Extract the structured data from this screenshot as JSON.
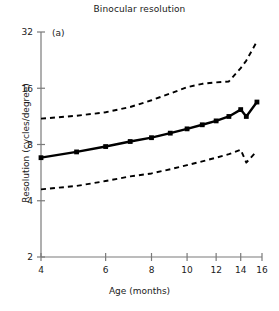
{
  "figure": {
    "title": "Binocular resolution",
    "panel_label": "(a)",
    "xlabel": "Age (months)",
    "ylabel": "Resolution (cycles/degree)",
    "line_color": "#000000",
    "background": "#ffffff",
    "axis_color": "#7a7a7a"
  },
  "chart_data": {
    "type": "line",
    "title": "Binocular resolution",
    "xlabel": "Age (months)",
    "ylabel": "Resolution (cycles/degree)",
    "annotations": [
      "(a)"
    ],
    "xscale": "log",
    "yscale": "log2",
    "xlim": [
      4,
      16
    ],
    "ylim": [
      2,
      32
    ],
    "xticks": [
      4,
      6,
      8,
      10,
      12,
      14,
      16
    ],
    "xticklabels": [
      "4",
      "6",
      "8",
      "10",
      "12",
      "14",
      "16"
    ],
    "yticks": [
      2,
      4,
      8,
      16,
      32
    ],
    "yticklabels": [
      "2",
      "4",
      "8",
      "16",
      "32"
    ],
    "grid": false,
    "legend": "none",
    "series": [
      {
        "name": "mean resolution",
        "style": "solid",
        "marker": "square",
        "x": [
          4.0,
          5.0,
          6.0,
          7.0,
          8.0,
          9.0,
          10.0,
          11.0,
          12.0,
          13.0,
          14.0,
          14.5,
          15.5
        ],
        "values": [
          6.8,
          7.3,
          7.8,
          8.3,
          8.7,
          9.2,
          9.7,
          10.2,
          10.7,
          11.3,
          12.3,
          11.3,
          13.5
        ]
      },
      {
        "name": "upper bound",
        "style": "dashed",
        "marker": "none",
        "x": [
          4.0,
          5.0,
          6.0,
          7.0,
          8.0,
          9.0,
          10.0,
          11.0,
          12.0,
          13.0,
          14.0,
          14.5,
          15.5
        ],
        "values": [
          11.0,
          11.4,
          11.9,
          12.7,
          13.8,
          15.0,
          16.2,
          16.9,
          17.2,
          17.4,
          20.5,
          22.5,
          28.5
        ]
      },
      {
        "name": "lower bound",
        "style": "dashed",
        "marker": "none",
        "x": [
          4.0,
          5.0,
          6.0,
          7.0,
          8.0,
          9.0,
          10.0,
          11.0,
          12.0,
          13.0,
          14.0,
          14.5,
          15.5
        ],
        "values": [
          4.6,
          4.8,
          5.1,
          5.4,
          5.6,
          5.9,
          6.2,
          6.5,
          6.8,
          7.1,
          7.5,
          6.4,
          7.4
        ]
      }
    ]
  }
}
